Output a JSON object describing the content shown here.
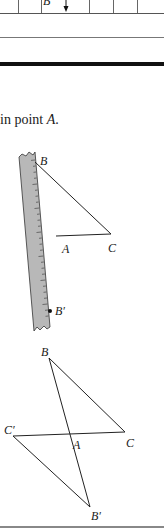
{
  "table_fragment": {
    "cell_label": "B",
    "arrow_icon": "down-arrow",
    "column_dividers_x": [
      18,
      41,
      89,
      113,
      137
    ]
  },
  "caption": {
    "text_prefix": "in point ",
    "point_name": "A",
    "text_suffix": "."
  },
  "figure_ruler": {
    "labels": {
      "B": "B",
      "A": "A",
      "C": "C",
      "B_prime": "B′"
    },
    "ruler_color": "#b8b8b8"
  },
  "figure_reflection": {
    "labels": {
      "B": "B",
      "C": "C",
      "C_prime": "C′",
      "A": "A",
      "B_prime": "B′"
    }
  }
}
